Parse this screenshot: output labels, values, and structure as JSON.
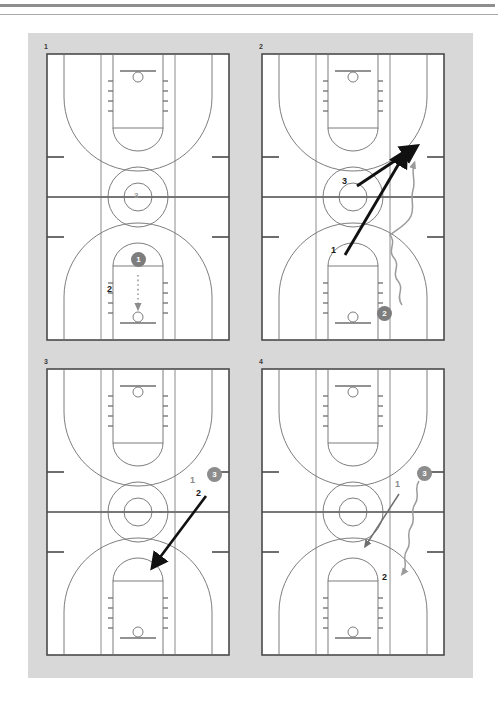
{
  "document": {
    "type": "basketball-play-diagram",
    "rules": [
      "rule-top-thick",
      "rule-top-thin"
    ],
    "board_background": "#d8d8d8",
    "court_line_color": "#555555",
    "player_marker_fill": "#7d7d7d",
    "player_marker_text": "#ffffff",
    "arrow_color": "#111111",
    "dribble_color": "#9b9b9b"
  },
  "panels": [
    {
      "number": "1",
      "name": "panel-1",
      "markers": [
        {
          "id": "m1-3",
          "label": "3",
          "style": "center-circle-text",
          "x": 93,
          "y": 137
        },
        {
          "id": "m1-1",
          "label": "1",
          "style": "filled-circle",
          "x": 85,
          "y": 192
        },
        {
          "id": "m1-2",
          "label": "2",
          "style": "bold-text",
          "x": 62,
          "y": 232
        }
      ],
      "actions": [
        {
          "id": "a1-shot",
          "type": "dotted-arrow",
          "from": "1",
          "to": "basket",
          "note": "shot/pass to basket"
        }
      ]
    },
    {
      "number": "2",
      "name": "panel-2",
      "markers": [
        {
          "id": "m2-3",
          "label": "3",
          "style": "bold-text",
          "x": 82,
          "y": 128
        },
        {
          "id": "m2-1",
          "label": "1",
          "style": "bold-text",
          "x": 70,
          "y": 196
        },
        {
          "id": "m2-2",
          "label": "2",
          "style": "filled-circle",
          "x": 116,
          "y": 253
        }
      ],
      "actions": [
        {
          "id": "a2-cut3",
          "type": "solid-arrow",
          "from": "3",
          "to": "wing",
          "note": "3 cuts to right wing"
        },
        {
          "id": "a2-cut1",
          "type": "solid-arrow",
          "from": "1",
          "to": "wing",
          "note": "1 cuts to right wing"
        },
        {
          "id": "a2-dribble2",
          "type": "dribble-wave",
          "from": "2",
          "to": "right-sideline",
          "note": "2 dribbles up right sideline"
        }
      ]
    },
    {
      "number": "3",
      "name": "panel-3",
      "markers": [
        {
          "id": "m3-1",
          "label": "1",
          "style": "grey-text",
          "x": 145,
          "y": 111
        },
        {
          "id": "m3-3",
          "label": "3",
          "style": "filled-circle",
          "x": 163,
          "y": 104
        },
        {
          "id": "m3-2",
          "label": "2",
          "style": "bold-text",
          "x": 150,
          "y": 124
        }
      ],
      "actions": [
        {
          "id": "a3-cut",
          "type": "solid-arrow",
          "from": "2",
          "to": "low-left",
          "note": "cut toward far basket"
        }
      ]
    },
    {
      "number": "4",
      "name": "panel-4",
      "markers": [
        {
          "id": "m4-3",
          "label": "3",
          "style": "filled-circle",
          "x": 156,
          "y": 101
        },
        {
          "id": "m4-1",
          "label": "1",
          "style": "grey-text",
          "x": 134,
          "y": 114
        },
        {
          "id": "m4-2",
          "label": "2",
          "style": "bold-text",
          "x": 121,
          "y": 208
        }
      ],
      "actions": [
        {
          "id": "a4-dribble3",
          "type": "dribble-wave",
          "from": "3",
          "to": "low-right",
          "note": "3 dribbles down right side"
        },
        {
          "id": "a4-cut1",
          "type": "thin-arrow",
          "from": "1",
          "to": "low-left",
          "note": "1 cuts toward middle"
        }
      ]
    }
  ]
}
